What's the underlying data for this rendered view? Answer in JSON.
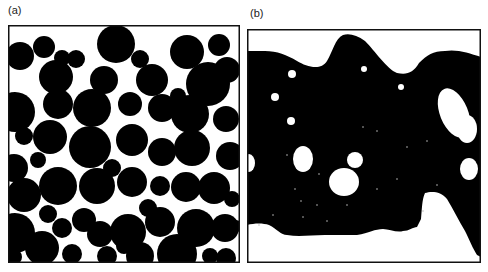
{
  "figure": {
    "panels": [
      {
        "label": "(a)",
        "description": "Dispersed spherical particles (black) in continuous white matrix",
        "frame": {
          "x": 8,
          "y": 25,
          "w": 232,
          "h": 238
        },
        "background": "#ffffff",
        "foreground": "#000000",
        "circles": [
          [
            116,
            44,
            19
          ],
          [
            20,
            56,
            14
          ],
          [
            44,
            47,
            11
          ],
          [
            56,
            77,
            17
          ],
          [
            62,
            58,
            8
          ],
          [
            76,
            59,
            9
          ],
          [
            104,
            80,
            14
          ],
          [
            140,
            59,
            9
          ],
          [
            152,
            80,
            16
          ],
          [
            187,
            52,
            17
          ],
          [
            219,
            45,
            11
          ],
          [
            227,
            70,
            13
          ],
          [
            208,
            84,
            22
          ],
          [
            58,
            104,
            15
          ],
          [
            92,
            108,
            19
          ],
          [
            130,
            104,
            12
          ],
          [
            162,
            108,
            14
          ],
          [
            190,
            114,
            19
          ],
          [
            226,
            119,
            13
          ],
          [
            15,
            112,
            20
          ],
          [
            50,
            137,
            17
          ],
          [
            90,
            147,
            21
          ],
          [
            132,
            140,
            16
          ],
          [
            162,
            152,
            14
          ],
          [
            192,
            148,
            18
          ],
          [
            230,
            156,
            14
          ],
          [
            14,
            168,
            14
          ],
          [
            38,
            160,
            8
          ],
          [
            24,
            195,
            17
          ],
          [
            58,
            186,
            19
          ],
          [
            97,
            186,
            18
          ],
          [
            132,
            182,
            15
          ],
          [
            160,
            186,
            10
          ],
          [
            186,
            187,
            15
          ],
          [
            214,
            188,
            16
          ],
          [
            232,
            199,
            8
          ],
          [
            15,
            233,
            20
          ],
          [
            48,
            214,
            9
          ],
          [
            62,
            228,
            10
          ],
          [
            84,
            220,
            12
          ],
          [
            100,
            234,
            13
          ],
          [
            128,
            232,
            18
          ],
          [
            160,
            222,
            15
          ],
          [
            196,
            228,
            19
          ],
          [
            225,
            228,
            14
          ],
          [
            42,
            248,
            17
          ],
          [
            107,
            256,
            10
          ],
          [
            140,
            256,
            14
          ],
          [
            177,
            254,
            20
          ],
          [
            210,
            256,
            8
          ],
          [
            226,
            258,
            10
          ],
          [
            14,
            257,
            8
          ],
          [
            72,
            254,
            10
          ],
          [
            124,
            246,
            8
          ],
          [
            148,
            208,
            9
          ],
          [
            24,
            136,
            9
          ],
          [
            112,
            168,
            9
          ],
          [
            178,
            96,
            8
          ],
          [
            236,
            226,
            6
          ]
        ]
      },
      {
        "label": "(b)",
        "description": "Bicontinuous/phase-inverted morphology: black matrix with white voids",
        "frame": {
          "x": 247,
          "y": 29,
          "w": 234,
          "h": 234
        },
        "background": "#000000",
        "foreground": "#ffffff",
        "top_white_path": "M0,0 L234,0 L234,28 C222,24 210,20 198,22 C186,22 180,26 172,34 C166,44 160,46 150,44 C140,40 128,22 118,12 C110,6 102,4 96,6 C88,10 86,22 80,32 C74,42 60,38 50,32 C40,26 30,22 18,22 C10,22 4,22 0,22 Z",
        "bottom_white_path": "M0,234 L0,196 C8,194 16,194 22,196 C30,200 34,206 40,206 C52,208 64,206 78,206 C90,206 100,206 110,206 C122,204 128,200 136,200 C142,200 150,204 156,202 C162,202 166,198 170,198 L174,190 C175,180 175,170 178,164 C184,162 194,162 200,170 C206,180 212,192 218,202 C222,210 226,220 230,226 L234,228 L234,234 Z",
        "holes": [
          {
            "cx": 207,
            "cy": 84,
            "rx": 14,
            "ry": 26,
            "rot": -22
          },
          {
            "cx": 220,
            "cy": 100,
            "rx": 10,
            "ry": 14,
            "rot": 0
          },
          {
            "cx": 56,
            "cy": 130,
            "rx": 10,
            "ry": 13,
            "rot": 0
          },
          {
            "cx": 108,
            "cy": 131,
            "rx": 8,
            "ry": 8,
            "rot": 0
          },
          {
            "cx": 97,
            "cy": 153,
            "rx": 15,
            "ry": 14,
            "rot": 0
          },
          {
            "cx": 154,
            "cy": 58,
            "rx": 3,
            "ry": 3,
            "rot": 0
          },
          {
            "cx": 28,
            "cy": 68,
            "rx": 4,
            "ry": 4,
            "rot": 0
          },
          {
            "cx": 44,
            "cy": 92,
            "rx": 4,
            "ry": 4,
            "rot": 0
          },
          {
            "cx": 2,
            "cy": 134,
            "rx": 6,
            "ry": 9,
            "rot": 0
          },
          {
            "cx": 222,
            "cy": 140,
            "rx": 9,
            "ry": 11,
            "rot": 0
          },
          {
            "cx": 45,
            "cy": 45,
            "rx": 4,
            "ry": 4,
            "rot": 0
          },
          {
            "cx": 117,
            "cy": 40,
            "rx": 3,
            "ry": 3,
            "rot": 0
          }
        ],
        "specks": [
          [
            40,
            126
          ],
          [
            72,
            145
          ],
          [
            48,
            160
          ],
          [
            54,
            172
          ],
          [
            26,
            186
          ],
          [
            56,
            188
          ],
          [
            70,
            176
          ],
          [
            100,
            176
          ],
          [
            130,
            160
          ],
          [
            150,
            150
          ],
          [
            176,
            182
          ],
          [
            116,
            98
          ],
          [
            130,
            102
          ],
          [
            160,
            118
          ],
          [
            180,
            112
          ],
          [
            190,
            156
          ],
          [
            12,
            196
          ],
          [
            80,
            192
          ]
        ]
      }
    ]
  }
}
